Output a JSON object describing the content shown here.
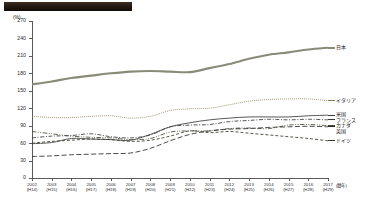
{
  "header": {
    "redacted_title": "",
    "unit_label": "(%)"
  },
  "axis": {
    "y_unit": "(%)",
    "y_ticks": [
      "0",
      "30",
      "60",
      "90",
      "120",
      "150",
      "180",
      "210",
      "240",
      "270"
    ],
    "x_note": "(暦年)"
  },
  "chart_data": {
    "type": "line",
    "title": "",
    "xlabel": "(暦年)",
    "ylabel": "(%)",
    "ylim": [
      0,
      270
    ],
    "grid": false,
    "legend_position": "right-end-labels",
    "categories": [
      "2002",
      "2003",
      "2004",
      "2005",
      "2006",
      "2007",
      "2008",
      "2009",
      "2010",
      "2011",
      "2012",
      "2013",
      "2014",
      "2015",
      "2016",
      "2017"
    ],
    "era_labels": [
      "(H14)",
      "(H15)",
      "(H16)",
      "(H17)",
      "(H18)",
      "(H19)",
      "(H20)",
      "(H21)",
      "(H22)",
      "(H23)",
      "(H24)",
      "(H25)",
      "(H26)",
      "(H27)",
      "(H28)",
      "(H29)"
    ],
    "series": [
      {
        "name": "日本",
        "color": "#8a8a78",
        "style": "solid-thick",
        "values": [
          161,
          166,
          172,
          176,
          180,
          183,
          184,
          183,
          182,
          189,
          196,
          205,
          212,
          216,
          221,
          224
        ]
      },
      {
        "name": "イタリア",
        "color": "#8a7a52",
        "style": "dotted",
        "values": [
          106,
          104,
          104,
          106,
          107,
          103,
          106,
          116,
          119,
          120,
          126,
          132,
          135,
          136,
          136,
          133
        ]
      },
      {
        "name": "米国",
        "color": "#3a3a3a",
        "style": "solid-thin",
        "values": [
          59,
          61,
          68,
          67,
          66,
          65,
          75,
          88,
          95,
          100,
          103,
          105,
          105,
          105,
          107,
          108
        ]
      },
      {
        "name": "フランス",
        "color": "#3a3a3a",
        "style": "dash-dot",
        "values": [
          69,
          72,
          73,
          76,
          71,
          69,
          74,
          88,
          91,
          92,
          97,
          99,
          101,
          100,
          101,
          100
        ]
      },
      {
        "name": "カナダ",
        "color": "#4a4a3a",
        "style": "dash-dot-dot",
        "values": [
          80,
          76,
          72,
          70,
          69,
          66,
          68,
          79,
          81,
          81,
          85,
          86,
          85,
          91,
          92,
          90
        ]
      },
      {
        "name": "英国",
        "color": "#2a2a2a",
        "style": "long-dash",
        "values": [
          37,
          38,
          40,
          41,
          42,
          43,
          51,
          64,
          75,
          81,
          84,
          85,
          87,
          88,
          89,
          88
        ]
      },
      {
        "name": "ドイツ",
        "color": "#3a3a2a",
        "style": "dashed",
        "values": [
          60,
          63,
          65,
          67,
          66,
          63,
          65,
          72,
          81,
          78,
          80,
          77,
          74,
          71,
          68,
          64
        ]
      }
    ]
  }
}
